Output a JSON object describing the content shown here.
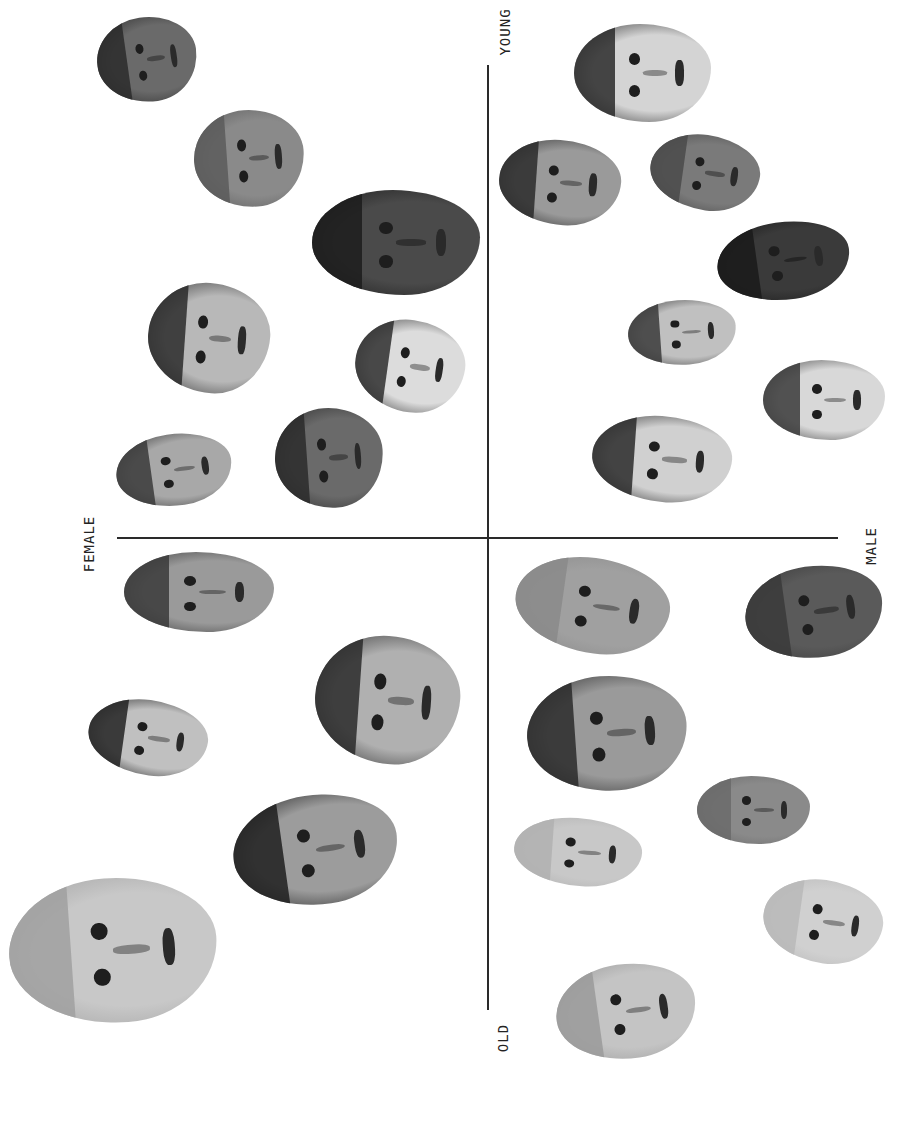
{
  "figure": {
    "axes": {
      "horizontal": {
        "start_x": 117,
        "end_x": 838,
        "y": 538
      },
      "vertical": {
        "x": 488,
        "start_y": 65,
        "end_y": 1010
      }
    },
    "labels": {
      "top": "YOUNG",
      "bottom": "OLD",
      "left": "FEMALE",
      "right": "MALE"
    },
    "faces": [
      {
        "id": "f1",
        "quadrant": "female-young",
        "x": 97,
        "y": 17,
        "w": 100,
        "h": 85,
        "skin": "#6a6a6a",
        "hair": "#2a2a2a"
      },
      {
        "id": "f2",
        "quadrant": "female-young",
        "x": 194,
        "y": 110,
        "w": 110,
        "h": 97,
        "skin": "#8a8a8a",
        "hair": "#5a5a5a"
      },
      {
        "id": "f3",
        "quadrant": "female-young",
        "x": 312,
        "y": 190,
        "w": 168,
        "h": 105,
        "skin": "#4a4a4a",
        "hair": "#1c1c1c"
      },
      {
        "id": "f4",
        "quadrant": "female-young",
        "x": 148,
        "y": 283,
        "w": 122,
        "h": 110,
        "skin": "#b8b8b8",
        "hair": "#2a2a2a"
      },
      {
        "id": "f5",
        "quadrant": "female-young",
        "x": 355,
        "y": 320,
        "w": 110,
        "h": 92,
        "skin": "#dcdcdc",
        "hair": "#2e2e2e"
      },
      {
        "id": "f6",
        "quadrant": "female-young",
        "x": 116,
        "y": 434,
        "w": 116,
        "h": 72,
        "skin": "#a8a8a8",
        "hair": "#3a3a3a"
      },
      {
        "id": "f7",
        "quadrant": "female-young",
        "x": 275,
        "y": 408,
        "w": 108,
        "h": 100,
        "skin": "#6a6a6a",
        "hair": "#2a2a2a"
      },
      {
        "id": "f8",
        "quadrant": "female-old",
        "x": 124,
        "y": 552,
        "w": 150,
        "h": 80,
        "skin": "#9a9a9a",
        "hair": "#3a3a3a"
      },
      {
        "id": "f9",
        "quadrant": "female-old",
        "x": 315,
        "y": 636,
        "w": 145,
        "h": 128,
        "skin": "#b0b0b0",
        "hair": "#2a2a2a"
      },
      {
        "id": "f10",
        "quadrant": "female-old",
        "x": 88,
        "y": 700,
        "w": 120,
        "h": 75,
        "skin": "#c0c0c0",
        "hair": "#222222"
      },
      {
        "id": "f11",
        "quadrant": "female-old",
        "x": 233,
        "y": 795,
        "w": 165,
        "h": 110,
        "skin": "#9c9c9c",
        "hair": "#1f1f1f"
      },
      {
        "id": "f12",
        "quadrant": "female-old",
        "x": 9,
        "y": 878,
        "w": 208,
        "h": 145,
        "skin": "#c8c8c8",
        "hair": "#a0a0a0"
      },
      {
        "id": "m1",
        "quadrant": "male-young",
        "x": 574,
        "y": 24,
        "w": 137,
        "h": 98,
        "skin": "#d4d4d4",
        "hair": "#2a2a2a"
      },
      {
        "id": "m2",
        "quadrant": "male-young",
        "x": 499,
        "y": 140,
        "w": 122,
        "h": 85,
        "skin": "#9a9a9a",
        "hair": "#2a2a2a"
      },
      {
        "id": "m3",
        "quadrant": "male-young",
        "x": 650,
        "y": 135,
        "w": 110,
        "h": 75,
        "skin": "#7a7a7a",
        "hair": "#4a4a4a"
      },
      {
        "id": "m4",
        "quadrant": "male-young",
        "x": 717,
        "y": 222,
        "w": 133,
        "h": 78,
        "skin": "#3a3a3a",
        "hair": "#1a1a1a"
      },
      {
        "id": "m5",
        "quadrant": "male-young",
        "x": 628,
        "y": 300,
        "w": 108,
        "h": 65,
        "skin": "#c0c0c0",
        "hair": "#3a3a3a"
      },
      {
        "id": "m6",
        "quadrant": "male-young",
        "x": 763,
        "y": 360,
        "w": 122,
        "h": 80,
        "skin": "#d8d8d8",
        "hair": "#3a3a3a"
      },
      {
        "id": "m7",
        "quadrant": "male-young",
        "x": 592,
        "y": 416,
        "w": 140,
        "h": 86,
        "skin": "#d0d0d0",
        "hair": "#2a2a2a"
      },
      {
        "id": "m8",
        "quadrant": "male-old",
        "x": 515,
        "y": 558,
        "w": 155,
        "h": 95,
        "skin": "#a0a0a0",
        "hair": "#8a8a8a"
      },
      {
        "id": "m9",
        "quadrant": "male-old",
        "x": 745,
        "y": 566,
        "w": 138,
        "h": 92,
        "skin": "#5a5a5a",
        "hair": "#3a3a3a"
      },
      {
        "id": "m10",
        "quadrant": "male-old",
        "x": 527,
        "y": 676,
        "w": 160,
        "h": 115,
        "skin": "#9a9a9a",
        "hair": "#2a2a2a"
      },
      {
        "id": "m11",
        "quadrant": "male-old",
        "x": 697,
        "y": 776,
        "w": 113,
        "h": 68,
        "skin": "#8a8a8a",
        "hair": "#6a6a6a"
      },
      {
        "id": "m12",
        "quadrant": "male-old",
        "x": 514,
        "y": 818,
        "w": 128,
        "h": 68,
        "skin": "#c8c8c8",
        "hair": "#b0b0b0"
      },
      {
        "id": "m13",
        "quadrant": "male-old",
        "x": 763,
        "y": 880,
        "w": 120,
        "h": 83,
        "skin": "#d0d0d0",
        "hair": "#b8b8b8"
      },
      {
        "id": "m14",
        "quadrant": "male-old",
        "x": 556,
        "y": 964,
        "w": 140,
        "h": 95,
        "skin": "#c4c4c4",
        "hair": "#9a9a9a"
      }
    ]
  }
}
